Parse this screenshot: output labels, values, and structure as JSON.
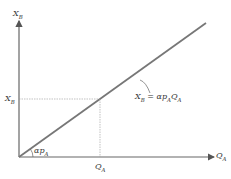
{
  "diagram": {
    "y_axis_label": {
      "main": "X",
      "sub": "B"
    },
    "x_axis_label": {
      "main": "Q",
      "sub": "A"
    },
    "y_tick_label": {
      "main": "X",
      "sub": "B"
    },
    "x_tick_label": {
      "main": "Q",
      "sub": "A"
    },
    "slope_label": {
      "main": "αp",
      "sub": "A"
    },
    "line_equation": {
      "lhs_main": "X",
      "lhs_sub": "B",
      "eq": " = αp",
      "mid_sub": "A",
      "rhs_main": "Q",
      "rhs_sub": "A"
    },
    "colors": {
      "axis": "#555555",
      "line": "#777777",
      "guide": "#999999",
      "text": "#333333"
    }
  }
}
